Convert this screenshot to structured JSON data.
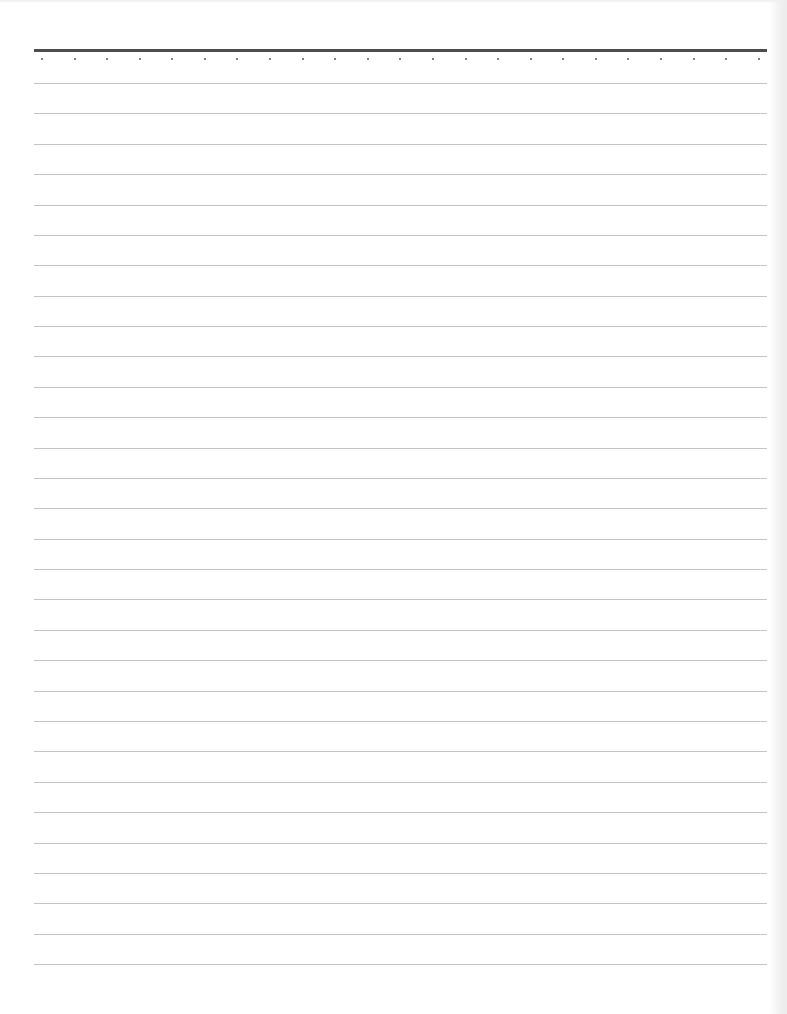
{
  "page": {
    "type": "lined-notebook-paper",
    "width": 787,
    "height": 1014,
    "background_color": "#ffffff"
  },
  "header_rule": {
    "x_start": 34,
    "x_end": 767,
    "y": 50,
    "thickness": 3,
    "color": "#4d4d4d"
  },
  "dots": {
    "count": 23,
    "y": 59,
    "x_start": 42,
    "spacing": 32.58,
    "size": 2,
    "color": "#5a5a5a"
  },
  "ruled_lines": {
    "count": 30,
    "y_start": 83,
    "spacing": 30.38,
    "x_start": 34,
    "x_end": 767,
    "thickness": 1,
    "color": "#c4c4c4"
  },
  "content": {
    "text": ""
  }
}
